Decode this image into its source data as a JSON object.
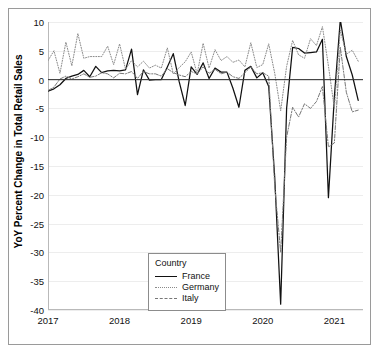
{
  "chart_data": {
    "type": "line",
    "title": "",
    "xlabel": "",
    "ylabel": "YoY Percent Change in Total Retail Sales",
    "ylim": [
      -40,
      10
    ],
    "xlim": [
      2017.0,
      2021.4
    ],
    "grid": true,
    "y_ticks": [
      10,
      5,
      0,
      -5,
      -10,
      -15,
      -20,
      -25,
      -30,
      -35,
      -40
    ],
    "y_tick_labels": [
      "10",
      "5",
      "0",
      "-5",
      "-10",
      "-15",
      "-20",
      "-25",
      "-30",
      "-35",
      "-40"
    ],
    "x_ticks": [
      2017,
      2018,
      2019,
      2020,
      2021
    ],
    "x_tick_labels": [
      "2017",
      "2018",
      "2019",
      "2020",
      "2021"
    ],
    "legend": {
      "title": "Country",
      "position": "lower-left",
      "entries": [
        {
          "label": "France",
          "style": "solid",
          "color": "#111111"
        },
        {
          "label": "Germany",
          "style": "dotted",
          "color": "#8a8a8a"
        },
        {
          "label": "Italy",
          "style": "dashdot",
          "color": "#777777"
        }
      ]
    },
    "x": [
      2017.0,
      2017.083,
      2017.167,
      2017.25,
      2017.333,
      2017.417,
      2017.5,
      2017.583,
      2017.667,
      2017.75,
      2017.833,
      2017.917,
      2018.0,
      2018.083,
      2018.167,
      2018.25,
      2018.333,
      2018.417,
      2018.5,
      2018.583,
      2018.667,
      2018.75,
      2018.833,
      2018.917,
      2019.0,
      2019.083,
      2019.167,
      2019.25,
      2019.333,
      2019.417,
      2019.5,
      2019.583,
      2019.667,
      2019.75,
      2019.833,
      2019.917,
      2020.0,
      2020.083,
      2020.167,
      2020.25,
      2020.333,
      2020.417,
      2020.5,
      2020.583,
      2020.667,
      2020.75,
      2020.833,
      2020.917,
      2021.0,
      2021.083,
      2021.167,
      2021.25,
      2021.333
    ],
    "series": [
      {
        "name": "France",
        "style": "solid",
        "color": "#111111",
        "values": [
          -2.0,
          -1.6,
          -0.9,
          0.2,
          0.6,
          0.9,
          1.6,
          0.5,
          2.3,
          1.2,
          1.5,
          1.6,
          1.5,
          1.7,
          5.3,
          -2.6,
          1.7,
          -0.1,
          0.0,
          0.0,
          2.2,
          4.5,
          -0.4,
          -4.5,
          2.2,
          0.9,
          2.9,
          0.2,
          2.0,
          1.3,
          1.3,
          -1.5,
          -4.8,
          1.6,
          2.3,
          0.3,
          1.2,
          -1.2,
          -17.0,
          -39.0,
          -5.0,
          5.6,
          5.4,
          4.6,
          4.7,
          4.8,
          7.0,
          -20.5,
          -3.0,
          10.4,
          4.0,
          0.8,
          -3.6
        ]
      },
      {
        "name": "Germany",
        "style": "dotted",
        "color": "#8a8a8a",
        "values": [
          3.3,
          5.0,
          1.1,
          6.5,
          2.4,
          8.0,
          3.7,
          4.0,
          4.0,
          4.0,
          5.8,
          2.6,
          6.2,
          1.8,
          3.3,
          2.2,
          3.2,
          2.0,
          2.5,
          2.0,
          5.5,
          1.0,
          2.1,
          3.1,
          4.8,
          1.0,
          6.3,
          2.0,
          5.2,
          3.3,
          4.0,
          3.0,
          3.4,
          2.2,
          6.4,
          2.1,
          2.6,
          6.2,
          1.1,
          -5.4,
          2.3,
          6.8,
          4.3,
          3.7,
          7.1,
          5.9,
          9.2,
          2.4,
          -5.0,
          8.6,
          4.4,
          5.1,
          3.2
        ]
      },
      {
        "name": "Italy",
        "style": "dashdot",
        "color": "#777777",
        "values": [
          -1.9,
          -1.3,
          0.1,
          0.6,
          0.1,
          0.5,
          1.0,
          0.4,
          0.6,
          1.2,
          1.0,
          0.3,
          1.1,
          1.0,
          1.4,
          0.2,
          1.4,
          1.0,
          1.0,
          0.6,
          1.9,
          1.2,
          0.8,
          0.5,
          1.4,
          1.0,
          2.2,
          1.1,
          1.8,
          1.0,
          1.3,
          0.5,
          0.2,
          1.2,
          2.2,
          1.0,
          1.2,
          0.6,
          -18.5,
          -30.0,
          -10.0,
          -4.8,
          -6.5,
          -4.2,
          -5.0,
          -3.8,
          -1.2,
          -11.7,
          -11.0,
          5.6,
          -2.2,
          -5.6,
          -5.3
        ]
      }
    ]
  },
  "legend_box": {
    "title": "Country",
    "items": [
      "France",
      "Germany",
      "Italy"
    ]
  },
  "axes": {
    "y_label": "YoY Percent Change in Total Retail Sales"
  }
}
